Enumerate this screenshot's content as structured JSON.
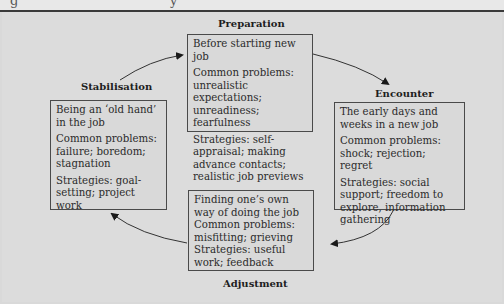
{
  "figure": {
    "caption_fragment": "g                         y",
    "stages": [
      {
        "id": "preparation",
        "label": "Preparation",
        "description": "Before starting new job",
        "problems": "Common problems: unrealistic expectations; unreadiness; fearfulness",
        "strategies": "Strategies: self-appraisal; making advance contacts; realistic job previews"
      },
      {
        "id": "encounter",
        "label": "Encounter",
        "description": "The early days and weeks in a new job",
        "problems": "Common problems: shock; rejection; regret",
        "strategies": "Strategies: social support; freedom to explore, information gathering"
      },
      {
        "id": "adjustment",
        "label": "Adjustment",
        "description": "Finding one’s own way of doing the job",
        "problems": "Common problems: misfitting; grieving",
        "strategies": "Strategies: useful work; feedback"
      },
      {
        "id": "stabilisation",
        "label": "Stabilisation",
        "description": "Being an ‘old hand’ in the job",
        "problems": "Common problems: failure; boredom; stagnation",
        "strategies": "Strategies: goal-setting; project work"
      }
    ],
    "cycle": [
      "Preparation",
      "Encounter",
      "Adjustment",
      "Stabilisation",
      "Preparation"
    ],
    "colors": {
      "background": "#d9d9d9",
      "border": "#4a4a4a",
      "text": "#2b2b2b",
      "rule": "#3a3a3a"
    }
  }
}
